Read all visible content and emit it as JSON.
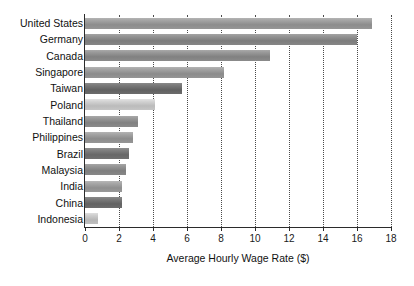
{
  "chart_data": {
    "type": "bar",
    "orientation": "horizontal",
    "title": "",
    "xlabel": "Average Hourly Wage Rate ($)",
    "ylabel": "",
    "xlim": [
      0,
      18
    ],
    "xticks": [
      0,
      2,
      4,
      6,
      8,
      10,
      12,
      14,
      16,
      18
    ],
    "xtick_labels": [
      "0",
      "2",
      "4",
      "6",
      "8",
      "10",
      "12",
      "14",
      "16",
      "18"
    ],
    "grid": "vertical-dotted",
    "legend": "none",
    "categories": [
      "United States",
      "Germany",
      "Canada",
      "Singapore",
      "Taiwan",
      "Poland",
      "Thailand",
      "Philippines",
      "Brazil",
      "Malaysia",
      "India",
      "China",
      "Indonesia"
    ],
    "values": [
      16.9,
      16.0,
      10.9,
      8.2,
      5.7,
      4.1,
      3.1,
      2.8,
      2.6,
      2.4,
      2.2,
      2.2,
      0.75
    ],
    "bar_colors": [
      "#9a9a9a",
      "#8a8a8a",
      "#8f8f8f",
      "#999999",
      "#6f6f6f",
      "#c9c9c9",
      "#8f8f8f",
      "#9a9a9a",
      "#757575",
      "#8c8c8c",
      "#9d9d9d",
      "#707070",
      "#c4c4c4"
    ]
  },
  "style": {
    "background": "#ffffff",
    "axis_color": "#2b2b2b",
    "text_color": "#111111",
    "grid_color": "#4a4a4a"
  }
}
